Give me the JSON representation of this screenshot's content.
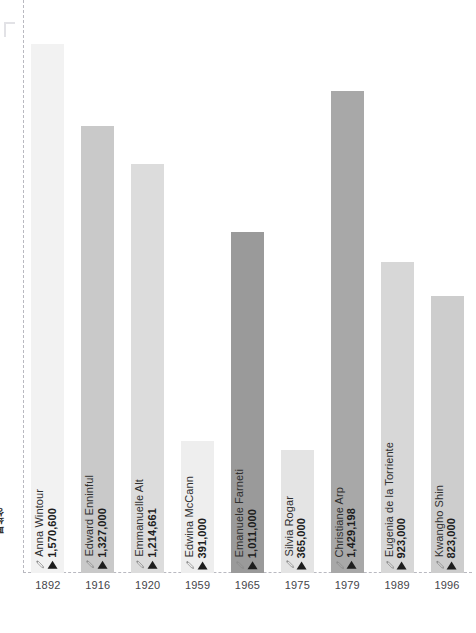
{
  "axis_caption": "폐쇄성",
  "icons": {
    "pencil": "pencil-icon",
    "marker": "triangle-up-icon"
  },
  "chart_data": {
    "type": "bar",
    "title": "",
    "xlabel": "",
    "ylabel": "",
    "grid": false,
    "legend": "none",
    "ylim": [
      0,
      1700000
    ],
    "categories": [
      "1892",
      "1916",
      "1920",
      "1959",
      "1965",
      "1975",
      "1979",
      "1989",
      "1996"
    ],
    "names": [
      "Anna Wintour",
      "Edward Enninful",
      "Emmanuelle Alt",
      "Edwina McCann",
      "Emanuele Farneti",
      "Silvia Rogar",
      "Christiane Arp",
      "Eugenia de la Torriente",
      "Kwangho Shin"
    ],
    "values": [
      1570600,
      1327000,
      1214661,
      391000,
      1011000,
      365000,
      1429198,
      923000,
      823000
    ],
    "value_labels": [
      "1,570,600",
      "1,327,000",
      "1,214,661",
      "391,000",
      "1,011,000",
      "365,000",
      "1,429,198",
      "923,000",
      "823,000"
    ],
    "colors": [
      "#f2f2f2",
      "#c9c9c9",
      "#dcdcdc",
      "#eeeeee",
      "#9a9a9a",
      "#e4e4e4",
      "#a8a8a8",
      "#d7d7d7",
      "#cdcdcd"
    ]
  }
}
